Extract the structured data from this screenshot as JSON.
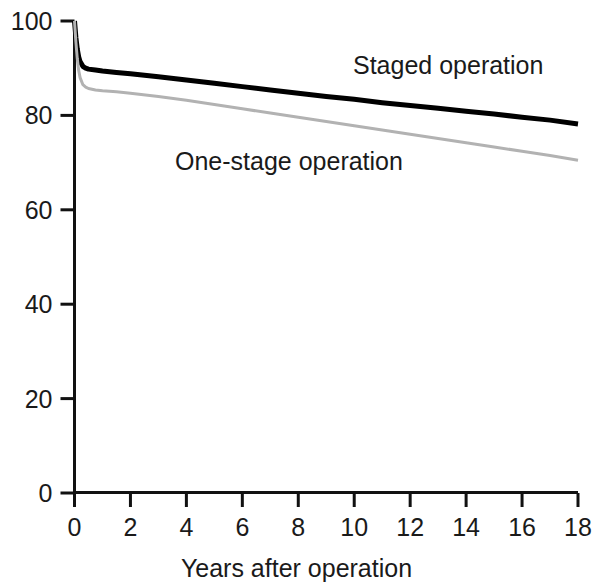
{
  "chart_data": {
    "type": "line",
    "title": "",
    "subtitle": "",
    "xlabel": "Years after operation",
    "ylabel": "",
    "xlim": [
      0,
      18
    ],
    "ylim": [
      0,
      100
    ],
    "xticks": [
      "0",
      "2",
      "4",
      "6",
      "8",
      "10",
      "12",
      "14",
      "16",
      "18"
    ],
    "yticks": [
      "0",
      "20",
      "40",
      "60",
      "80",
      "100"
    ],
    "grid": false,
    "legend_position": "inline-annotations",
    "series": [
      {
        "name": "Staged operation",
        "color": "#000000",
        "line_width": 5,
        "x": [
          0,
          0.05,
          0.1,
          0.15,
          0.2,
          0.3,
          0.4,
          0.5,
          0.75,
          1,
          1.5,
          2,
          3,
          4,
          5,
          6,
          7,
          8,
          9,
          10,
          11,
          12,
          13,
          14,
          15,
          16,
          17,
          18
        ],
        "values": [
          100,
          96.5,
          94,
          92.4,
          91.4,
          90.4,
          90.0,
          89.8,
          89.6,
          89.4,
          89.1,
          88.8,
          88.2,
          87.5,
          86.8,
          86.1,
          85.4,
          84.7,
          84.0,
          83.4,
          82.7,
          82.1,
          81.5,
          80.9,
          80.3,
          79.6,
          79.0,
          78.2
        ]
      },
      {
        "name": "One-stage operation",
        "color": "#b2b2b2",
        "line_width": 3,
        "x": [
          0,
          0.05,
          0.1,
          0.15,
          0.2,
          0.3,
          0.4,
          0.5,
          0.75,
          1,
          1.5,
          2,
          3,
          4,
          5,
          6,
          7,
          8,
          9,
          10,
          11,
          12,
          13,
          14,
          15,
          16,
          17,
          18
        ],
        "values": [
          100,
          95.5,
          92.0,
          89.5,
          88.0,
          86.5,
          86.0,
          85.7,
          85.4,
          85.2,
          85.0,
          84.7,
          84.0,
          83.2,
          82.3,
          81.4,
          80.5,
          79.6,
          78.7,
          77.8,
          76.9,
          76.0,
          75.1,
          74.2,
          73.3,
          72.4,
          71.5,
          70.5
        ]
      }
    ],
    "annotations": [
      {
        "text": "Staged operation",
        "x_px": 353,
        "y_px": 53,
        "series": "Staged operation"
      },
      {
        "text": "One-stage operation",
        "x_px": 175,
        "y_px": 149,
        "series": "One-stage operation"
      }
    ]
  },
  "axis": {
    "line_color": "#111111",
    "x_title": "Years after operation"
  }
}
